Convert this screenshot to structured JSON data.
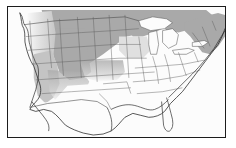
{
  "figure": {
    "type": "choropleth-map",
    "title": "",
    "region": "Continental United States with adjacent Mexico and Canada",
    "frame": {
      "visible": true,
      "border_color": "#1c1c1c",
      "border_width_px": 1,
      "background_color": "#fcfcfc"
    },
    "projection_note": "Conic, North America"
  },
  "map_data": {
    "type": "choropleth",
    "description": "Grayscale shaded map of the United States. A broad dark-gray band covers the northern tier from the inland Pacific Northwest across the Northern Rockies and Great Plains to the Upper Midwest and the Northeast. Intermediate gray covers the Great Basin and Southwest transition. The South, Southeast, Texas, Gulf Coast, coastal California, Mexico and most of Canada are unshaded white.",
    "shading_classes": [
      {
        "id": "dark",
        "label": "High",
        "color": "#a9a9a9"
      },
      {
        "id": "medium",
        "label": "Moderate",
        "color": "#c4c4c4"
      },
      {
        "id": "light",
        "label": "Low",
        "color": "#e0e0e0"
      },
      {
        "id": "none",
        "label": "Not shaded",
        "color": "#fcfcfc"
      }
    ],
    "outline_color": "#5a5a5a",
    "coast_color": "#2e2e2e",
    "regions_dark": [
      "Montana",
      "Wyoming",
      "Colorado",
      "North Dakota",
      "South Dakota",
      "Nebraska (north)",
      "Minnesota",
      "Wisconsin (north)",
      "Michigan (upper)",
      "New York",
      "Vermont",
      "New Hampshire",
      "Maine",
      "Massachusetts",
      "Idaho (east)",
      "Ontario (south)"
    ],
    "regions_medium": [
      "Nevada",
      "Utah",
      "Arizona (north)",
      "New Mexico (north)",
      "Oregon (east)",
      "Washington (east)",
      "Kansas (west)",
      "Iowa (north)"
    ],
    "regions_unshaded": [
      "California",
      "Texas",
      "Oklahoma",
      "Arkansas",
      "Louisiana",
      "Mississippi",
      "Alabama",
      "Georgia",
      "Florida",
      "South Carolina",
      "North Carolina",
      "Tennessee",
      "Kentucky",
      "Missouri",
      "Illinois",
      "Indiana",
      "Ohio",
      "Virginia",
      "West Virginia",
      "Pennsylvania",
      "Mexico"
    ],
    "water_features": [
      "Lake Superior",
      "Lake Michigan",
      "Lake Huron",
      "Lake Erie",
      "Lake Ontario",
      "Gulf of Mexico",
      "Pacific Ocean",
      "Atlantic Ocean"
    ]
  }
}
